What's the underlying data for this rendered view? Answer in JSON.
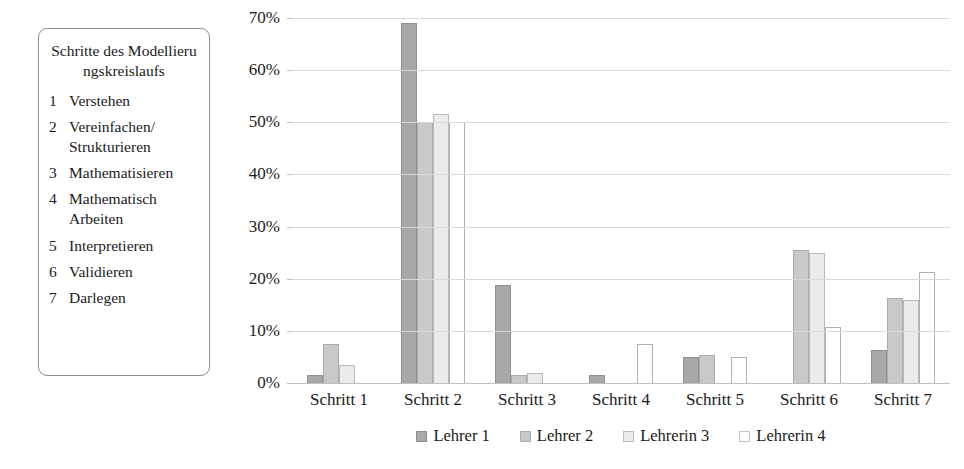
{
  "steps_panel": {
    "title": "Schritte des Modellierungskreislaufs",
    "items": [
      {
        "num": "1",
        "label": "Verstehen"
      },
      {
        "num": "2",
        "label": "Vereinfachen/ Strukturieren"
      },
      {
        "num": "3",
        "label": "Mathematisieren"
      },
      {
        "num": "4",
        "label": "Mathematisch Arbeiten"
      },
      {
        "num": "5",
        "label": "Interpretieren"
      },
      {
        "num": "6",
        "label": "Validieren"
      },
      {
        "num": "7",
        "label": "Darlegen"
      }
    ]
  },
  "chart_data": {
    "type": "bar",
    "title": "",
    "subtitle": "",
    "xlabel": "",
    "ylabel": "",
    "ylim": [
      0,
      70
    ],
    "ytick_labels": [
      "0%",
      "10%",
      "20%",
      "30%",
      "40%",
      "50%",
      "60%",
      "70%"
    ],
    "ytick_values": [
      0,
      10,
      20,
      30,
      40,
      50,
      60,
      70
    ],
    "grid": true,
    "legend_position": "bottom",
    "categories": [
      "Schritt 1",
      "Schritt 2",
      "Schritt 3",
      "Schritt 4",
      "Schritt 5",
      "Schritt 6",
      "Schritt 7"
    ],
    "series": [
      {
        "name": "Lehrer 1",
        "color": "#a8a8a8",
        "values": [
          1.5,
          69.0,
          18.8,
          1.5,
          5.0,
          0.0,
          6.3
        ]
      },
      {
        "name": "Lehrer 2",
        "color": "#c9c9c9",
        "values": [
          7.5,
          50.0,
          1.5,
          0.0,
          5.3,
          25.6,
          16.3
        ]
      },
      {
        "name": "Lehrerin 3",
        "color": "#ebebeb",
        "values": [
          3.5,
          51.5,
          2.0,
          0.0,
          0.0,
          25.0,
          16.0
        ]
      },
      {
        "name": "Lehrerin 4",
        "color": "#ffffff",
        "values": [
          0.0,
          50.0,
          0.0,
          7.5,
          5.0,
          10.7,
          21.3
        ]
      }
    ]
  }
}
